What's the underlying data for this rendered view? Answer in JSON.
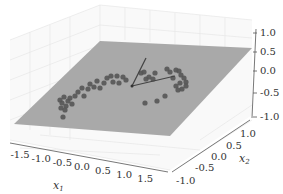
{
  "chart_data": {
    "type": "scatter3d",
    "title": "",
    "xlabel": "x1",
    "ylabel": "x2",
    "zlabel": "",
    "x_ticks": [
      "-1.5",
      "-1.0",
      "-0.5",
      "0.0",
      "0.5",
      "1.0",
      "1.5"
    ],
    "y_ticks": [
      "-1.0",
      "-0.5",
      "0.0",
      "0.5",
      "1.0"
    ],
    "z_ticks": [
      "1.0",
      "0.5",
      "0.0",
      "-0.5",
      "-1.0"
    ],
    "xlim": [
      -1.8,
      1.8
    ],
    "ylim": [
      -1.3,
      1.3
    ],
    "zlim": [
      -1.0,
      1.0
    ],
    "grid": true,
    "elements": [
      {
        "type": "plane",
        "color": "#a8a8a8",
        "description": "grey projection hyperplane"
      },
      {
        "type": "scatter",
        "color": "#555555",
        "description": "3D data points lying near the plane, curved band from left to right"
      },
      {
        "type": "arrows",
        "count": 2,
        "color": "#444444",
        "description": "two principal axis vectors from a common origin"
      }
    ],
    "points_screen": [
      [
        60,
        100
      ],
      [
        62,
        103
      ],
      [
        64,
        97
      ],
      [
        66,
        106
      ],
      [
        68,
        101
      ],
      [
        61,
        108
      ],
      [
        65,
        110
      ],
      [
        63,
        117
      ],
      [
        70,
        98
      ],
      [
        72,
        104
      ],
      [
        75,
        96
      ],
      [
        78,
        92
      ],
      [
        82,
        88
      ],
      [
        84,
        96
      ],
      [
        88,
        89
      ],
      [
        90,
        84
      ],
      [
        94,
        87
      ],
      [
        97,
        81
      ],
      [
        100,
        88
      ],
      [
        104,
        83
      ],
      [
        107,
        78
      ],
      [
        111,
        76
      ],
      [
        113,
        82
      ],
      [
        117,
        76
      ],
      [
        119,
        83
      ],
      [
        123,
        77
      ],
      [
        126,
        80
      ],
      [
        141,
        73
      ],
      [
        144,
        72
      ],
      [
        146,
        79
      ],
      [
        149,
        77
      ],
      [
        153,
        79
      ],
      [
        155,
        73
      ],
      [
        167,
        69
      ],
      [
        170,
        72
      ],
      [
        173,
        78
      ],
      [
        176,
        70
      ],
      [
        179,
        71
      ],
      [
        181,
        75
      ],
      [
        184,
        78
      ],
      [
        186,
        82
      ],
      [
        180,
        83
      ],
      [
        176,
        86
      ],
      [
        178,
        90
      ],
      [
        182,
        89
      ],
      [
        186,
        86
      ],
      [
        145,
        103
      ],
      [
        157,
        101
      ],
      [
        165,
        96
      ]
    ],
    "arrows_screen": [
      {
        "from": [
          132,
          86
        ],
        "to": [
          146,
          58
        ]
      },
      {
        "from": [
          132,
          86
        ],
        "to": [
          175,
          76
        ]
      }
    ]
  },
  "labels": {
    "x_axis": "x",
    "x_sub": "1",
    "y_axis": "x",
    "y_sub": "2"
  }
}
